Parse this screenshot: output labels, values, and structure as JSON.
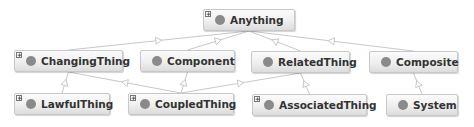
{
  "diagram": {
    "type": "class-hierarchy",
    "colors": {
      "edge": "#c8c8c8",
      "node_border": "#c8c8c8",
      "class_dot": "#8a8a8a",
      "text": "#333333"
    },
    "nodes": [
      {
        "id": "anything",
        "label": "Anything",
        "expandable": true,
        "x": 203,
        "y": 9,
        "w": 92,
        "h": 22
      },
      {
        "id": "changingthing",
        "label": "ChangingThing",
        "expandable": true,
        "x": 14,
        "y": 50,
        "w": 109,
        "h": 22
      },
      {
        "id": "component",
        "label": "Component",
        "expandable": false,
        "x": 140,
        "y": 50,
        "w": 95,
        "h": 22
      },
      {
        "id": "relatedthing",
        "label": "RelatedThing",
        "expandable": false,
        "x": 251,
        "y": 51,
        "w": 99,
        "h": 22
      },
      {
        "id": "composite",
        "label": "Composite",
        "expandable": false,
        "x": 369,
        "y": 51,
        "w": 89,
        "h": 22
      },
      {
        "id": "lawfulthing",
        "label": "LawfulThing",
        "expandable": true,
        "x": 14,
        "y": 93,
        "w": 96,
        "h": 22
      },
      {
        "id": "coupledthing",
        "label": "CoupledThing",
        "expandable": true,
        "x": 128,
        "y": 93,
        "w": 106,
        "h": 22
      },
      {
        "id": "associatedthing",
        "label": "AssociatedThing",
        "expandable": true,
        "x": 252,
        "y": 94,
        "w": 115,
        "h": 22
      },
      {
        "id": "system",
        "label": "System",
        "expandable": false,
        "x": 386,
        "y": 94,
        "w": 72,
        "h": 22
      }
    ],
    "edges": [
      {
        "from": "changingthing",
        "to": "anything",
        "relation": "subclass-of"
      },
      {
        "from": "component",
        "to": "anything",
        "relation": "subclass-of"
      },
      {
        "from": "relatedthing",
        "to": "anything",
        "relation": "subclass-of"
      },
      {
        "from": "composite",
        "to": "anything",
        "relation": "subclass-of"
      },
      {
        "from": "lawfulthing",
        "to": "changingthing",
        "relation": "subclass-of"
      },
      {
        "from": "coupledthing",
        "to": "changingthing",
        "relation": "subclass-of"
      },
      {
        "from": "coupledthing",
        "to": "component",
        "relation": "subclass-of"
      },
      {
        "from": "coupledthing",
        "to": "relatedthing",
        "relation": "subclass-of"
      },
      {
        "from": "associatedthing",
        "to": "relatedthing",
        "relation": "subclass-of"
      },
      {
        "from": "system",
        "to": "composite",
        "relation": "subclass-of"
      }
    ],
    "expand_glyph": "+"
  }
}
